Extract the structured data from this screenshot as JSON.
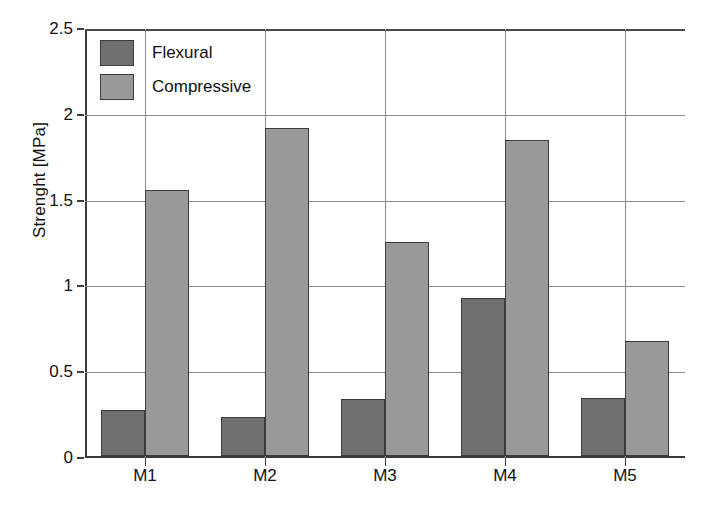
{
  "chart_data": {
    "type": "bar",
    "title": "",
    "xlabel": "",
    "ylabel": "Strenght [MPa]",
    "categories": [
      "M1",
      "M2",
      "M3",
      "M4",
      "M5"
    ],
    "series": [
      {
        "name": "Flexural",
        "color": "#6e6e6e",
        "values": [
          0.27,
          0.23,
          0.33,
          0.92,
          0.34
        ]
      },
      {
        "name": "Compressive",
        "color": "#9a9a9a",
        "values": [
          1.55,
          1.91,
          1.25,
          1.84,
          0.67
        ]
      }
    ],
    "ylim": [
      0,
      2.5
    ],
    "yticks": [
      0,
      0.5,
      1,
      1.5,
      2,
      2.5
    ],
    "ytick_labels": [
      "0",
      "0.5",
      "1",
      "1.5",
      "2",
      "2.5"
    ],
    "grid": "horizontal-and-vertical",
    "legend_position": "top-left"
  },
  "axes": {
    "y_title": "Strenght [MPa]",
    "y_tick_labels": [
      "2.5",
      "2",
      "1.5",
      "1",
      "0.5",
      "0"
    ],
    "x_tick_labels": [
      "M1",
      "M2",
      "M3",
      "M4",
      "M5"
    ]
  },
  "legend": {
    "items": [
      {
        "label": "Flexural"
      },
      {
        "label": "Compressive"
      }
    ]
  }
}
